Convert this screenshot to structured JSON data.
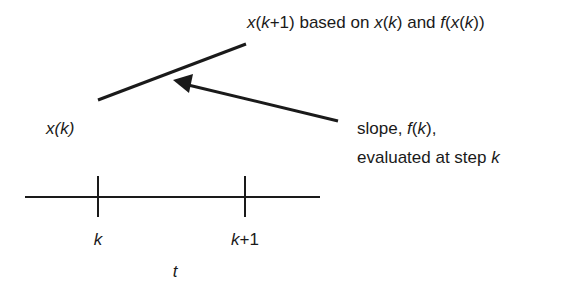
{
  "diagram": {
    "type": "euler-step-illustration",
    "labels": {
      "top_annotation": {
        "x_k1": "x",
        "paren_open": "(",
        "k1": "k",
        "plus_one": "+1) based on ",
        "x_k": "x",
        "paren_open_2": "(",
        "k": "k",
        "paren_close_and": ") and ",
        "f": "f",
        "paren_open_3": "(",
        "x_inner": "x",
        "paren_open_4": "(",
        "k_inner": "k",
        "paren_close_end": "))"
      },
      "start_point": {
        "x": "x",
        "open": "(",
        "k": "k",
        "close": ")"
      },
      "slope_annotation": {
        "line1_prefix": "slope, ",
        "line1_f": "f",
        "line1_open": "(",
        "line1_k": "k",
        "line1_close": "),",
        "line2_prefix": "evaluated at step ",
        "line2_k": "k"
      },
      "tick_k": "k",
      "tick_k1_k": "k",
      "tick_k1_suffix": "+1",
      "axis_label": "t"
    },
    "colors": {
      "ink": "#1a1a1a",
      "background": "#ffffff"
    }
  }
}
